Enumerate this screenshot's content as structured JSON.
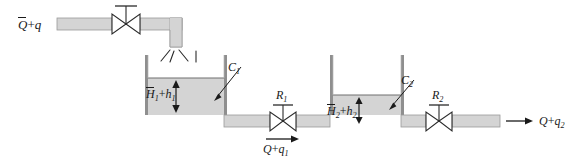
{
  "diagram": {
    "colors": {
      "fluid": "#d4d4d4",
      "wall": "#8f8f8f",
      "line": "#1a1a1a",
      "background": "#ffffff"
    },
    "labels": {
      "inlet_flow": {
        "base": "Q",
        "overbar": true,
        "plus": "+",
        "term": "q",
        "sub": ""
      },
      "tank1_head": {
        "base": "H",
        "overbar": true,
        "sub1": "1",
        "plus": "+",
        "term": "h",
        "sub2": "1"
      },
      "tank2_head": {
        "base": "H",
        "overbar": true,
        "sub1": "2",
        "plus": "+",
        "term": "h",
        "sub2": "2"
      },
      "capacitance1": {
        "base": "C",
        "sub": "1"
      },
      "capacitance2": {
        "base": "C",
        "sub": "2"
      },
      "resistance1": {
        "base": "R",
        "sub": "1"
      },
      "resistance2": {
        "base": "R",
        "sub": "2"
      },
      "mid_flow": {
        "base": "Q",
        "overbar": false,
        "plus": "+",
        "term": "q",
        "sub": "1"
      },
      "outlet_flow": {
        "base": "Q",
        "overbar": false,
        "plus": "+",
        "term": "q",
        "sub": "2"
      }
    },
    "components": {
      "inlet_valve": "inlet-control-valve",
      "spout": "inlet-spout-with-splash",
      "tank1": "tank-one",
      "tank2": "tank-two",
      "valve_r1": "resistance-valve-r1",
      "valve_r2": "resistance-valve-r2"
    }
  }
}
